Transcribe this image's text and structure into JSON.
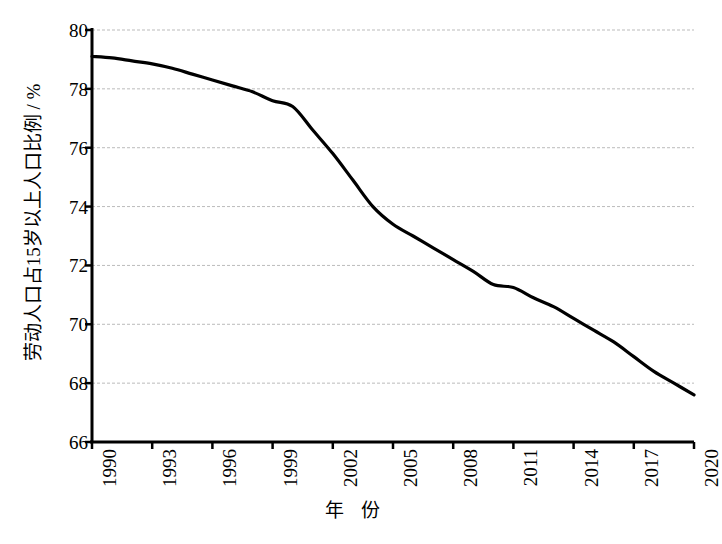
{
  "chart_data": {
    "type": "line",
    "title": "",
    "xlabel": "年 份",
    "ylabel": "劳动人口占15岁以上人口比例 / %",
    "xlim": [
      1990,
      2020
    ],
    "ylim": [
      66,
      80
    ],
    "grid": true,
    "legend": "none",
    "line_color": "#000000",
    "grid_color": "#bbbbbb",
    "axis_color": "#000000",
    "y_ticks": [
      66,
      68,
      70,
      72,
      74,
      76,
      78,
      80
    ],
    "y_tick_labels": [
      "66",
      "68",
      "70",
      "72",
      "74",
      "76",
      "78",
      "80"
    ],
    "x_ticks": [
      1990,
      1993,
      1996,
      1999,
      2002,
      2005,
      2008,
      2011,
      2014,
      2017,
      2020
    ],
    "x_tick_labels": [
      "1990",
      "1993",
      "1996",
      "1999",
      "2002",
      "2005",
      "2008",
      "2011",
      "2014",
      "2017",
      "2020"
    ],
    "series": [
      {
        "name": "劳动人口占15岁以上人口比例",
        "x": [
          1990,
          1991,
          1992,
          1993,
          1994,
          1995,
          1996,
          1997,
          1998,
          1999,
          2000,
          2001,
          2002,
          2003,
          2004,
          2005,
          2006,
          2007,
          2008,
          2009,
          2010,
          2011,
          2012,
          2013,
          2014,
          2015,
          2016,
          2017,
          2018,
          2019,
          2020
        ],
        "values": [
          79.1,
          79.05,
          78.95,
          78.85,
          78.7,
          78.5,
          78.3,
          78.1,
          77.9,
          77.6,
          77.4,
          76.6,
          75.8,
          74.9,
          74.0,
          73.4,
          73.0,
          72.6,
          72.2,
          71.8,
          71.35,
          71.25,
          70.9,
          70.6,
          70.2,
          69.8,
          69.4,
          68.9,
          68.4,
          68.0,
          67.6
        ]
      }
    ]
  }
}
